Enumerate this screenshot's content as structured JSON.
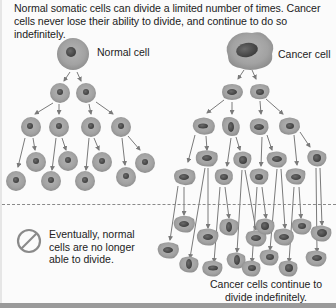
{
  "caption": "Normal somatic cells can divide a limited number of times. Cancer cells never lose their ability to divide, and continue to do so indefinitely.",
  "normal": {
    "label": "Normal cell",
    "note": "Eventually, normal cells are no longer able to divide.",
    "note_lines": [
      "Eventually, normal",
      "cells are no longer",
      "able to divide."
    ],
    "icon": "prohibited-icon"
  },
  "cancer": {
    "label": "Cancer cell",
    "note_lines": [
      "Cancer cells continue to",
      "divide indefinitely."
    ]
  },
  "colors": {
    "cell_fill": "#a3a3a3",
    "cell_edge": "#8e8e8e",
    "nucleus": "#555555",
    "arrow": "#7a7a7a",
    "background": "#fbfbfb"
  }
}
